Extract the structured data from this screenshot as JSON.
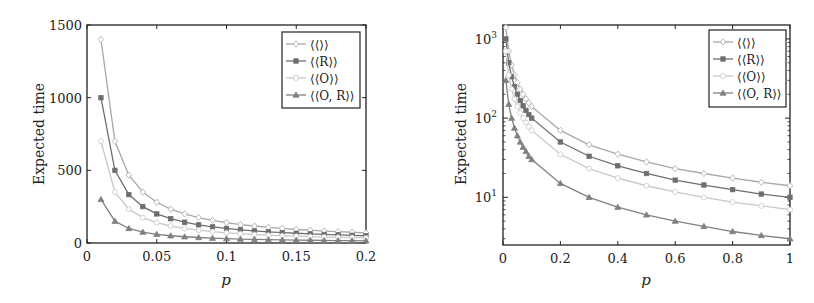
{
  "chart_data": [
    {
      "type": "line",
      "title": "",
      "xlabel": "p",
      "ylabel": "Expected time",
      "xscale": "linear",
      "yscale": "linear",
      "xlim": [
        0,
        0.2
      ],
      "ylim": [
        0,
        1500
      ],
      "xticks": [
        0,
        0.05,
        0.1,
        0.15,
        0.2
      ],
      "xtick_labels": [
        "0",
        "0.05",
        "0.1",
        "0.15",
        "0.2"
      ],
      "yticks": [
        0,
        500,
        1000,
        1500
      ],
      "ytick_labels": [
        "0",
        "500",
        "1000",
        "1500"
      ],
      "grid": false,
      "legend_position": "upper right",
      "x": [
        0.01,
        0.02,
        0.03,
        0.04,
        0.05,
        0.06,
        0.07,
        0.08,
        0.09,
        0.1,
        0.11,
        0.12,
        0.13,
        0.14,
        0.15,
        0.16,
        0.17,
        0.18,
        0.19,
        0.2
      ],
      "series": [
        {
          "name": "⟨⟨⟩⟩",
          "marker": "diamond",
          "color": "#a8a8a8",
          "values": [
            1400,
            700,
            467,
            350,
            280,
            233,
            200,
            175,
            156,
            140,
            127,
            117,
            108,
            100,
            93,
            88,
            82,
            78,
            74,
            70
          ]
        },
        {
          "name": "⟨⟨R⟩⟩",
          "marker": "square",
          "color": "#6e6e6e",
          "values": [
            1000,
            500,
            333,
            250,
            200,
            167,
            143,
            125,
            111,
            100,
            91,
            83,
            77,
            71,
            67,
            63,
            59,
            56,
            53,
            50
          ]
        },
        {
          "name": "⟨⟨O⟩⟩",
          "marker": "circle",
          "color": "#c8c8c8",
          "values": [
            700,
            350,
            233,
            175,
            140,
            117,
            100,
            88,
            78,
            70,
            64,
            58,
            54,
            50,
            47,
            44,
            41,
            39,
            37,
            35
          ]
        },
        {
          "name": "⟨⟨O, R⟩⟩",
          "marker": "triangle",
          "color": "#808080",
          "values": [
            300,
            150,
            100,
            75,
            60,
            50,
            43,
            38,
            33,
            30,
            27,
            25,
            23,
            21,
            20,
            19,
            18,
            17,
            16,
            15
          ]
        }
      ]
    },
    {
      "type": "line",
      "title": "",
      "xlabel": "p",
      "ylabel": "Expected time",
      "xscale": "linear",
      "yscale": "log",
      "xlim": [
        0,
        1
      ],
      "ylim": [
        2.5,
        1500
      ],
      "xticks": [
        0,
        0.2,
        0.4,
        0.6,
        0.8,
        1
      ],
      "xtick_labels": [
        "0",
        "0.2",
        "0.4",
        "0.6",
        "0.8",
        "1"
      ],
      "yticks": [
        10,
        100,
        1000
      ],
      "ytick_labels": [
        "10¹",
        "10²",
        "10³"
      ],
      "grid": false,
      "legend_position": "upper right",
      "x": [
        0.01,
        0.02,
        0.03,
        0.04,
        0.05,
        0.06,
        0.07,
        0.08,
        0.09,
        0.1,
        0.2,
        0.3,
        0.4,
        0.5,
        0.6,
        0.7,
        0.8,
        0.9,
        1.0
      ],
      "series": [
        {
          "name": "⟨⟨⟩⟩",
          "marker": "diamond",
          "color": "#a8a8a8",
          "values": [
            1400,
            700,
            467,
            350,
            280,
            233,
            200,
            175,
            156,
            140,
            70,
            46,
            35,
            28,
            23,
            20,
            17.5,
            15.5,
            14
          ]
        },
        {
          "name": "⟨⟨R⟩⟩",
          "marker": "square",
          "color": "#6e6e6e",
          "values": [
            1000,
            500,
            333,
            250,
            200,
            167,
            143,
            125,
            111,
            100,
            50,
            33,
            25,
            20,
            16.5,
            14.3,
            12.5,
            11,
            10
          ]
        },
        {
          "name": "⟨⟨O⟩⟩",
          "marker": "circle",
          "color": "#c8c8c8",
          "values": [
            700,
            350,
            233,
            175,
            140,
            117,
            100,
            88,
            78,
            70,
            35,
            23,
            17.5,
            14,
            11.7,
            10,
            8.7,
            7.8,
            7
          ]
        },
        {
          "name": "⟨⟨O, R⟩⟩",
          "marker": "triangle",
          "color": "#808080",
          "values": [
            300,
            150,
            100,
            75,
            60,
            50,
            43,
            38,
            33,
            30,
            15,
            10,
            7.5,
            6,
            5,
            4.3,
            3.7,
            3.3,
            3
          ]
        }
      ]
    }
  ],
  "figure": {
    "left_panel": {
      "ylabel": "Expected time",
      "xlabel": "p",
      "xtick_labels": [
        "0",
        "0.05",
        "0.1",
        "0.15",
        "0.2"
      ],
      "ytick_labels": [
        "0",
        "500",
        "1000",
        "1500"
      ],
      "legend": [
        "⟨⟨⟩⟩",
        "⟨⟨R⟩⟩",
        "⟨⟨O⟩⟩",
        "⟨⟨O, R⟩⟩"
      ]
    },
    "right_panel": {
      "ylabel": "Expected time",
      "xlabel": "p",
      "xtick_labels": [
        "0",
        "0.2",
        "0.4",
        "0.6",
        "0.8",
        "1"
      ],
      "ytick_labels": [
        "10",
        "10",
        "10"
      ],
      "ytick_exponents": [
        "1",
        "2",
        "3"
      ],
      "legend": [
        "⟨⟨⟩⟩",
        "⟨⟨R⟩⟩",
        "⟨⟨O⟩⟩",
        "⟨⟨O, R⟩⟩"
      ]
    }
  }
}
